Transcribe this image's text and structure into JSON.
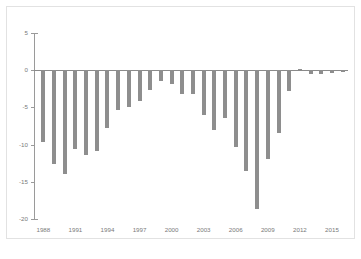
{
  "chart_data": {
    "type": "bar",
    "title": "",
    "subtitle": "",
    "xlabel": "",
    "ylabel": "",
    "grid": false,
    "legend": "none",
    "bar_color": "#8e8e8e",
    "axis_color": "#9a9a9a",
    "tick_label_color": "#7a7a7a",
    "frame_color": "#e2e2e2",
    "ylim": [
      -20,
      5
    ],
    "ytick_values": [
      5,
      0,
      -5,
      -10,
      -15,
      -20
    ],
    "ytick_labels": [
      "5",
      "0",
      "-5",
      "-10",
      "-15",
      "-20"
    ],
    "xtick_labels": [
      "1988",
      "1991",
      "1994",
      "1997",
      "2000",
      "2003",
      "2006",
      "2009",
      "2012",
      "2015"
    ],
    "xtick_categories": [
      1988,
      1991,
      1994,
      1997,
      2000,
      2003,
      2006,
      2009,
      2012,
      2015
    ],
    "categories": [
      1988,
      1989,
      1990,
      1991,
      1992,
      1993,
      1994,
      1995,
      1996,
      1997,
      1998,
      1999,
      2000,
      2001,
      2002,
      2003,
      2004,
      2005,
      2006,
      2007,
      2008,
      2009,
      2010,
      2011,
      2012,
      2013,
      2014,
      2015,
      2016
    ],
    "values": [
      -9.6,
      -12.6,
      -14.0,
      -10.6,
      -11.4,
      -10.9,
      -7.8,
      -5.4,
      -4.9,
      -4.2,
      -2.6,
      -1.4,
      -1.9,
      -3.2,
      -3.2,
      -6.0,
      -8.0,
      -6.4,
      -10.3,
      -13.6,
      -18.6,
      -12.0,
      -8.5,
      -2.8,
      0.2,
      -0.5,
      -0.5,
      -0.4,
      -0.3
    ]
  }
}
